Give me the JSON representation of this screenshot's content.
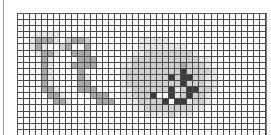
{
  "grid": {
    "cols": 41,
    "rows": 20,
    "colors": {
      "0": "#ffffff",
      "1": "#e6e6e6",
      "2": "#cfcfcf",
      "3": "#a8a8a8",
      "4": "#3c3c3c"
    },
    "cells": [
      "00000000000000000000000000000000000000000",
      "00000000000000000000000000000000000000000",
      "00000000000000000000000000000000000000000",
      "00011110000000000000000000000000000000000",
      "00133310233200000000111110000000000000000",
      "00131002300300000000111111110000000000000",
      "00013310033300000001122222222100000000000",
      "00003100003330000012222222222211000000000",
      "00003100033330000112222222232221000000000",
      "00003100003000000122222222242222100000000",
      "00003100003100000122222224244221100000000",
      "00003100003300000122222222242221100000000",
      "00003310003330000112222224124422100000000",
      "00000331000033300112224004124221000000000",
      "00000033100003330011222240441221000000000",
      "00000000000000000001122222222110000000000",
      "00000000000000000000011112111000000000000",
      "00000000000000000000000000000000000000000",
      "00000000000000000000000000000000000000000",
      "00000000000000000000000000000000000000000"
    ]
  }
}
